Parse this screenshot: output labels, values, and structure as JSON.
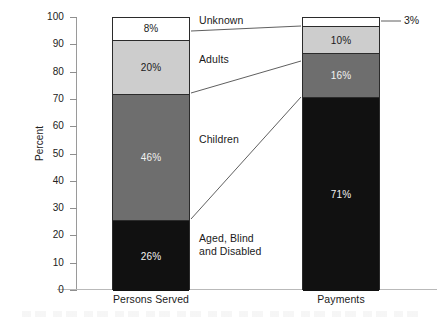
{
  "chart_data": {
    "type": "bar",
    "subtype": "stacked-100-percent",
    "title": "",
    "xlabel": "",
    "ylabel": "Percent",
    "ylim": [
      0,
      100
    ],
    "yticks": [
      0,
      10,
      20,
      30,
      40,
      50,
      60,
      70,
      80,
      90,
      100
    ],
    "ytick_labels": [
      "0",
      "10",
      "20",
      "30",
      "40",
      "50",
      "60",
      "70",
      "80",
      "90",
      "100"
    ],
    "grid": false,
    "legend_position": "between-bars-with-leader-lines",
    "categories": [
      "Persons Served",
      "Payments"
    ],
    "series": [
      {
        "name": "Aged, Blind and Disabled",
        "label": "Aged, Blind\nand Disabled",
        "values": [
          26,
          71
        ],
        "value_labels": [
          "26%",
          "71%"
        ],
        "color": "#111111",
        "text_color": "light"
      },
      {
        "name": "Children",
        "label": "Children",
        "values": [
          46,
          16
        ],
        "value_labels": [
          "46%",
          "16%"
        ],
        "color": "#6e6e6e",
        "text_color": "light"
      },
      {
        "name": "Adults",
        "label": "Adults",
        "values": [
          20,
          10
        ],
        "value_labels": [
          "20%",
          "10%"
        ],
        "color": "#cdcdcd",
        "text_color": "dark"
      },
      {
        "name": "Unknown",
        "label": "Unknown",
        "values": [
          8,
          3
        ],
        "value_labels": [
          "8%",
          "3%"
        ],
        "color": "#ffffff",
        "text_color": "dark"
      }
    ],
    "annotations": [
      {
        "text": "3%",
        "series": "Unknown",
        "category": "Payments",
        "placement": "outside-right-with-leader"
      }
    ]
  },
  "axis": {
    "y_title": "Percent",
    "ticks": [
      "100",
      "90",
      "80",
      "70",
      "60",
      "50",
      "40",
      "30",
      "20",
      "10",
      "0"
    ]
  },
  "bars": {
    "persons_served": {
      "name": "Persons Served",
      "segments": [
        {
          "label": "8%",
          "value": 8
        },
        {
          "label": "20%",
          "value": 20
        },
        {
          "label": "46%",
          "value": 46
        },
        {
          "label": "26%",
          "value": 26
        }
      ]
    },
    "payments": {
      "name": "Payments",
      "segments": [
        {
          "label": "",
          "value": 3
        },
        {
          "label": "10%",
          "value": 10
        },
        {
          "label": "16%",
          "value": 16
        },
        {
          "label": "71%",
          "value": 71
        }
      ]
    }
  },
  "category_labels": {
    "unknown": "Unknown",
    "adults": "Adults",
    "children": "Children",
    "aged_blind_disabled": "Aged, Blind\nand Disabled"
  },
  "callouts": {
    "payments_unknown": "3%"
  },
  "x_labels": {
    "persons_served": "Persons Served",
    "payments": "Payments"
  },
  "colors": {
    "aged_blind_disabled": "#111111",
    "children": "#6e6e6e",
    "adults": "#cdcdcd",
    "unknown": "#ffffff",
    "axis": "#9a9a9a",
    "bar_outline": "#2b2b2b",
    "background": "#ffffff"
  }
}
